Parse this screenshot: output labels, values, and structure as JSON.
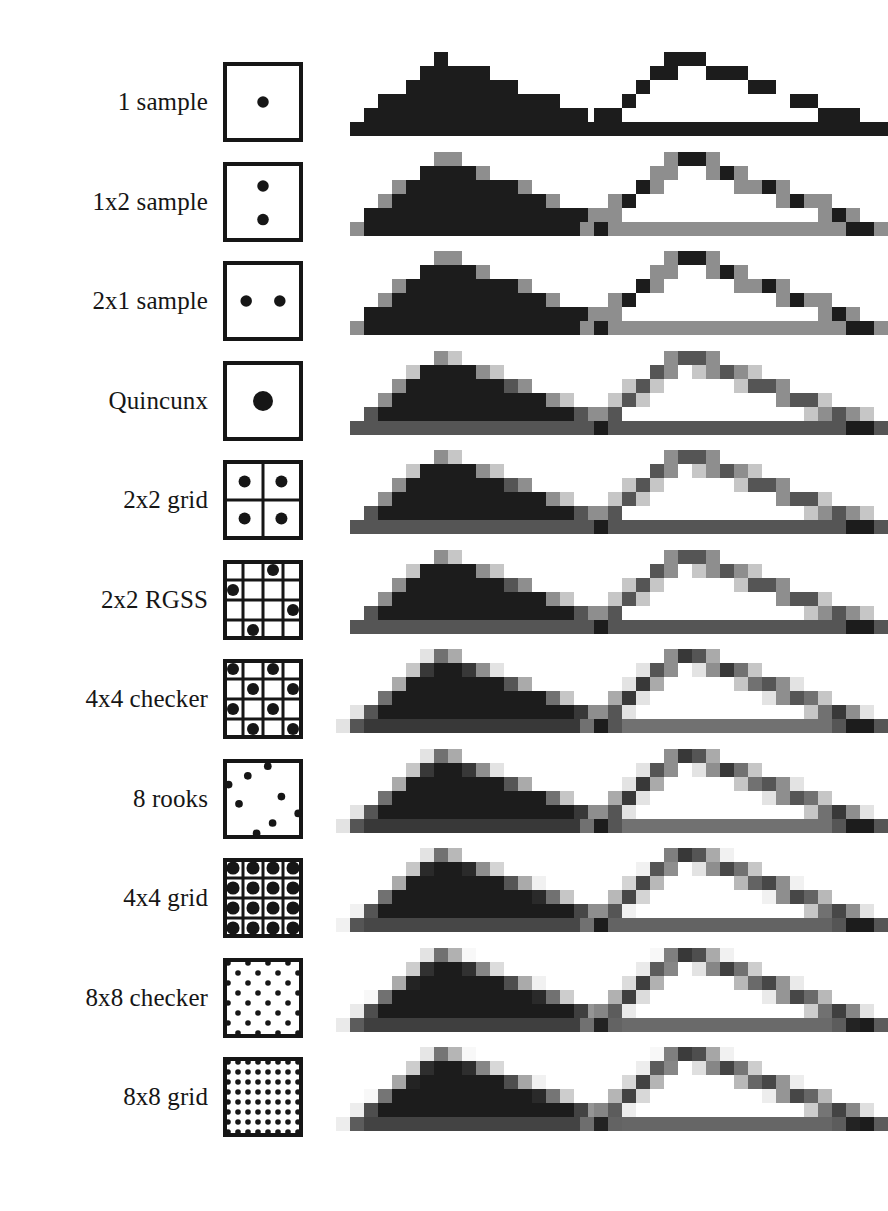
{
  "figure": {
    "background_color": "#ffffff",
    "ink_color": "#161616",
    "columns": [
      {
        "name": "pattern",
        "header": ""
      },
      {
        "name": "filled_triangle",
        "header": ""
      },
      {
        "name": "outline_triangle",
        "header": ""
      }
    ],
    "rows": [
      {
        "label": "1 sample",
        "pattern": "single-center-dot",
        "sample_count": 1,
        "gray_levels": 2,
        "dots": [
          [
            0.5,
            0.5
          ]
        ],
        "dot_radius": 0.072,
        "grid_lines": 0,
        "corner_dots": false
      },
      {
        "label": "1x2 sample",
        "pattern": "vertical-pair",
        "sample_count": 2,
        "gray_levels": 3,
        "dots": [
          [
            0.5,
            0.3
          ],
          [
            0.5,
            0.72
          ]
        ],
        "dot_radius": 0.072,
        "grid_lines": 0,
        "corner_dots": false
      },
      {
        "label": "2x1 sample",
        "pattern": "horizontal-pair",
        "sample_count": 2,
        "gray_levels": 3,
        "dots": [
          [
            0.29,
            0.5
          ],
          [
            0.71,
            0.5
          ]
        ],
        "dot_radius": 0.072,
        "grid_lines": 0,
        "corner_dots": false
      },
      {
        "label": "Quincunx",
        "pattern": "quincunx",
        "sample_count": 5,
        "gray_levels": 5,
        "dots": [
          [
            0.5,
            0.5
          ]
        ],
        "dot_radius": 0.125,
        "grid_lines": 0,
        "corner_dots": true
      },
      {
        "label": "2x2 grid",
        "pattern": "grid-2x2",
        "sample_count": 4,
        "gray_levels": 5,
        "dots": [
          [
            0.27,
            0.27
          ],
          [
            0.73,
            0.27
          ],
          [
            0.27,
            0.73
          ],
          [
            0.73,
            0.73
          ]
        ],
        "dot_radius": 0.075,
        "grid_lines": 2,
        "corner_dots": false
      },
      {
        "label": "2x2 RGSS",
        "pattern": "rotated-grid-supersampling",
        "sample_count": 4,
        "gray_levels": 5,
        "dots": [
          [
            0.625,
            0.125
          ],
          [
            0.125,
            0.375
          ],
          [
            0.875,
            0.625
          ],
          [
            0.375,
            0.875
          ]
        ],
        "dot_radius": 0.075,
        "grid_lines": 4,
        "corner_dots": false
      },
      {
        "label": "4x4 checker",
        "pattern": "checker-4x4",
        "sample_count": 8,
        "gray_levels": 9,
        "dots": [
          [
            0.125,
            0.125
          ],
          [
            0.625,
            0.125
          ],
          [
            0.375,
            0.375
          ],
          [
            0.875,
            0.375
          ],
          [
            0.125,
            0.625
          ],
          [
            0.625,
            0.625
          ],
          [
            0.375,
            0.875
          ],
          [
            0.875,
            0.875
          ]
        ],
        "dot_radius": 0.075,
        "grid_lines": 4,
        "corner_dots": false
      },
      {
        "label": "8 rooks",
        "pattern": "eight-rooks",
        "sample_count": 8,
        "gray_levels": 9,
        "dots": [
          [
            0.56,
            0.09
          ],
          [
            0.31,
            0.21
          ],
          [
            0.07,
            0.32
          ],
          [
            0.73,
            0.47
          ],
          [
            0.2,
            0.56
          ],
          [
            0.94,
            0.68
          ],
          [
            0.62,
            0.8
          ],
          [
            0.42,
            0.93
          ]
        ],
        "dot_radius": 0.048,
        "grid_lines": 0,
        "corner_dots": false
      },
      {
        "label": "4x4 grid",
        "pattern": "grid-4x4",
        "sample_count": 16,
        "gray_levels": 17,
        "dots": [
          [
            0.125,
            0.125
          ],
          [
            0.375,
            0.125
          ],
          [
            0.625,
            0.125
          ],
          [
            0.875,
            0.125
          ],
          [
            0.125,
            0.375
          ],
          [
            0.375,
            0.375
          ],
          [
            0.625,
            0.375
          ],
          [
            0.875,
            0.375
          ],
          [
            0.125,
            0.625
          ],
          [
            0.375,
            0.625
          ],
          [
            0.625,
            0.625
          ],
          [
            0.875,
            0.625
          ],
          [
            0.125,
            0.875
          ],
          [
            0.375,
            0.875
          ],
          [
            0.625,
            0.875
          ],
          [
            0.875,
            0.875
          ]
        ],
        "dot_radius": 0.082,
        "grid_lines": 4,
        "corner_dots": false
      },
      {
        "label": "8x8 checker",
        "pattern": "checker-8x8",
        "sample_count": 32,
        "gray_levels": 33,
        "dots": [
          [
            0.0625,
            0.0625
          ],
          [
            0.3125,
            0.0625
          ],
          [
            0.5625,
            0.0625
          ],
          [
            0.8125,
            0.0625
          ],
          [
            0.1875,
            0.1875
          ],
          [
            0.4375,
            0.1875
          ],
          [
            0.6875,
            0.1875
          ],
          [
            0.9375,
            0.1875
          ],
          [
            0.0625,
            0.3125
          ],
          [
            0.3125,
            0.3125
          ],
          [
            0.5625,
            0.3125
          ],
          [
            0.8125,
            0.3125
          ],
          [
            0.1875,
            0.4375
          ],
          [
            0.4375,
            0.4375
          ],
          [
            0.6875,
            0.4375
          ],
          [
            0.9375,
            0.4375
          ],
          [
            0.0625,
            0.5625
          ],
          [
            0.3125,
            0.5625
          ],
          [
            0.5625,
            0.5625
          ],
          [
            0.8125,
            0.5625
          ],
          [
            0.1875,
            0.6875
          ],
          [
            0.4375,
            0.6875
          ],
          [
            0.6875,
            0.6875
          ],
          [
            0.9375,
            0.6875
          ],
          [
            0.0625,
            0.8125
          ],
          [
            0.3125,
            0.8125
          ],
          [
            0.5625,
            0.8125
          ],
          [
            0.8125,
            0.8125
          ],
          [
            0.1875,
            0.9375
          ],
          [
            0.4375,
            0.9375
          ],
          [
            0.6875,
            0.9375
          ],
          [
            0.9375,
            0.9375
          ]
        ],
        "dot_radius": 0.035,
        "grid_lines": 0,
        "corner_dots": false
      },
      {
        "label": "8x8 grid",
        "pattern": "grid-8x8",
        "sample_count": 64,
        "gray_levels": 65,
        "dots": "generate-8x8",
        "dot_radius": 0.035,
        "grid_lines": 0,
        "corner_dots": false
      }
    ],
    "triangle": {
      "description": "Stair-stepped rasterized triangle, rendered filled (middle column) and as an outline (right column)",
      "filled_fill": "#1c1c1c",
      "outline_stroke": "#1c1c1c",
      "pixel_size": 14
    }
  }
}
